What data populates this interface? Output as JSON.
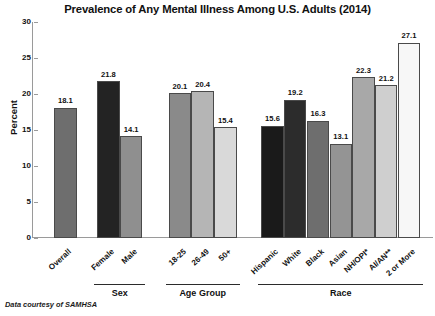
{
  "chart_data": {
    "type": "bar",
    "title": "Prevalence of Any Mental Illness Among U.S. Adults (2014)",
    "xlabel": "",
    "ylabel": "Percent",
    "ylim": [
      0,
      30
    ],
    "ytick_step": 5,
    "yticks": [
      "30",
      "25",
      "20",
      "15",
      "10",
      "5",
      "0"
    ],
    "grid": false,
    "legend": "none",
    "categories": [
      "Overall",
      "Female",
      "Male",
      "18-25",
      "26-49",
      "50+",
      "Hispanic",
      "White",
      "Black",
      "Asian",
      "NH/OPI*",
      "AI/AN**",
      "2 or More"
    ],
    "values": [
      18.1,
      21.8,
      14.1,
      20.1,
      20.4,
      15.4,
      15.6,
      19.2,
      16.3,
      13.1,
      22.3,
      21.2,
      27.1
    ],
    "value_labels": [
      "18.1",
      "21.8",
      "14.1",
      "20.1",
      "20.4",
      "15.4",
      "15.6",
      "19.2",
      "16.3",
      "13.1",
      "22.3",
      "21.2",
      "27.1"
    ],
    "bar_colors": [
      "#6e6e6e",
      "#232323",
      "#8f8f8f",
      "#8a8a8a",
      "#b5b5b5",
      "#d9d9d9",
      "#1a1a1a",
      "#2c2c2c",
      "#6e6e6e",
      "#949494",
      "#a8a8a8",
      "#cfcfcf",
      "#f7f7f7"
    ],
    "bar_edge_color": "#4a4a4a",
    "axis_color": "#9a9a9a",
    "groups": [
      {
        "label": "Sex",
        "from": 1,
        "to": 2
      },
      {
        "label": "Age Group",
        "from": 3,
        "to": 5
      },
      {
        "label": "Race",
        "from": 6,
        "to": 12
      }
    ],
    "annotations": [
      "Data courtesy of SAMHSA"
    ]
  },
  "footnote": "Data courtesy of SAMHSA"
}
